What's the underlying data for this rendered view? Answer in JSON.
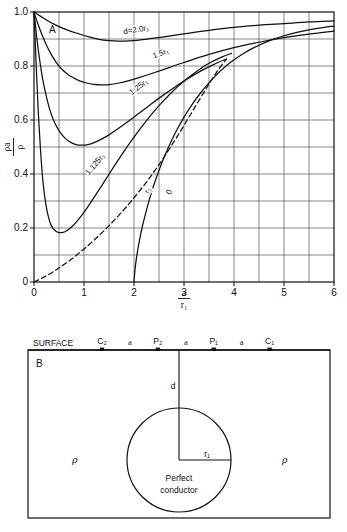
{
  "figure": {
    "panel_a_label": "A",
    "panel_b_label": "B"
  },
  "chart_data": {
    "type": "line",
    "title": "",
    "xlabel_numerator": "a",
    "xlabel_denominator": "r₁",
    "ylabel_numerator": "ρa",
    "ylabel_denominator": "ρ",
    "xlim": [
      0,
      6
    ],
    "ylim": [
      0,
      1.0
    ],
    "grid": true,
    "x_major_ticks": [
      0,
      1,
      2,
      3,
      4,
      5,
      6
    ],
    "x_major_tick_labels": [
      "0",
      "1",
      "2",
      "3",
      "4",
      "5",
      "6"
    ],
    "x_minor_step": 0.5,
    "y_major_ticks": [
      0,
      0.2,
      0.4,
      0.6,
      0.8,
      1.0
    ],
    "y_major_tick_labels": [
      "0",
      "0.2",
      "0.4",
      "0.6",
      "0.8",
      "1.0"
    ],
    "y_minor_step": 0.1,
    "legend_position": "inline-annotations",
    "series": [
      {
        "name": "d=2.0r₁",
        "label": "d=2.0r₁",
        "style": "solid",
        "label_x": 2.05,
        "label_y": 0.925,
        "label_rotation": -9,
        "points": [
          [
            0.0,
            1.0
          ],
          [
            0.1,
            0.988
          ],
          [
            0.2,
            0.976
          ],
          [
            0.3,
            0.965
          ],
          [
            0.4,
            0.955
          ],
          [
            0.5,
            0.946
          ],
          [
            0.7,
            0.931
          ],
          [
            0.9,
            0.919
          ],
          [
            1.1,
            0.908
          ],
          [
            1.3,
            0.899
          ],
          [
            1.5,
            0.894
          ],
          [
            1.7,
            0.892
          ],
          [
            1.9,
            0.893
          ],
          [
            2.1,
            0.896
          ],
          [
            2.4,
            0.903
          ],
          [
            2.7,
            0.911
          ],
          [
            3.0,
            0.919
          ],
          [
            3.5,
            0.932
          ],
          [
            4.0,
            0.943
          ],
          [
            4.5,
            0.951
          ],
          [
            5.0,
            0.957
          ],
          [
            5.5,
            0.963
          ],
          [
            6.0,
            0.967
          ]
        ]
      },
      {
        "name": "1.5r₁",
        "label": "1.5r₁",
        "style": "solid",
        "label_x": 2.55,
        "label_y": 0.838,
        "label_rotation": -20,
        "points": [
          [
            0.0,
            1.0
          ],
          [
            0.07,
            0.96
          ],
          [
            0.15,
            0.92
          ],
          [
            0.25,
            0.877
          ],
          [
            0.35,
            0.841
          ],
          [
            0.45,
            0.812
          ],
          [
            0.55,
            0.79
          ],
          [
            0.65,
            0.773
          ],
          [
            0.75,
            0.76
          ],
          [
            0.9,
            0.746
          ],
          [
            1.05,
            0.737
          ],
          [
            1.2,
            0.732
          ],
          [
            1.35,
            0.73
          ],
          [
            1.5,
            0.731
          ],
          [
            1.7,
            0.737
          ],
          [
            1.9,
            0.746
          ],
          [
            2.1,
            0.757
          ],
          [
            2.4,
            0.775
          ],
          [
            2.7,
            0.794
          ],
          [
            3.0,
            0.813
          ],
          [
            3.5,
            0.843
          ],
          [
            4.0,
            0.868
          ],
          [
            4.5,
            0.888
          ],
          [
            5.0,
            0.905
          ],
          [
            5.5,
            0.918
          ],
          [
            6.0,
            0.929
          ]
        ]
      },
      {
        "name": "1.25r₁",
        "label": "1.25r₁",
        "style": "solid",
        "label_x": 2.12,
        "label_y": 0.715,
        "label_rotation": -37,
        "points": [
          [
            0.0,
            1.0
          ],
          [
            0.05,
            0.915
          ],
          [
            0.1,
            0.84
          ],
          [
            0.17,
            0.755
          ],
          [
            0.25,
            0.685
          ],
          [
            0.33,
            0.63
          ],
          [
            0.42,
            0.587
          ],
          [
            0.52,
            0.555
          ],
          [
            0.62,
            0.533
          ],
          [
            0.72,
            0.519
          ],
          [
            0.84,
            0.509
          ],
          [
            0.96,
            0.507
          ],
          [
            1.08,
            0.509
          ],
          [
            1.2,
            0.516
          ],
          [
            1.35,
            0.529
          ],
          [
            1.5,
            0.545
          ],
          [
            1.7,
            0.57
          ],
          [
            1.9,
            0.597
          ],
          [
            2.1,
            0.625
          ],
          [
            2.35,
            0.66
          ],
          [
            2.6,
            0.694
          ],
          [
            2.85,
            0.726
          ],
          [
            3.1,
            0.756
          ],
          [
            3.35,
            0.783
          ],
          [
            3.6,
            0.806
          ],
          [
            3.85,
            0.826
          ]
        ]
      },
      {
        "name": "1.125r₁",
        "label": "1.125r₁",
        "style": "solid",
        "label_x": 1.26,
        "label_y": 0.43,
        "label_rotation": -50,
        "points": [
          [
            0.0,
            1.0
          ],
          [
            0.04,
            0.82
          ],
          [
            0.08,
            0.65
          ],
          [
            0.13,
            0.49
          ],
          [
            0.18,
            0.37
          ],
          [
            0.24,
            0.285
          ],
          [
            0.3,
            0.233
          ],
          [
            0.36,
            0.204
          ],
          [
            0.43,
            0.189
          ],
          [
            0.5,
            0.183
          ],
          [
            0.58,
            0.184
          ],
          [
            0.66,
            0.191
          ],
          [
            0.75,
            0.204
          ],
          [
            0.85,
            0.223
          ],
          [
            0.95,
            0.246
          ],
          [
            1.1,
            0.285
          ],
          [
            1.25,
            0.327
          ],
          [
            1.4,
            0.37
          ],
          [
            1.6,
            0.428
          ],
          [
            1.8,
            0.484
          ],
          [
            2.0,
            0.537
          ],
          [
            2.25,
            0.598
          ],
          [
            2.5,
            0.653
          ],
          [
            2.75,
            0.702
          ],
          [
            3.0,
            0.744
          ],
          [
            3.25,
            0.78
          ],
          [
            3.5,
            0.81
          ],
          [
            3.75,
            0.833
          ],
          [
            3.95,
            0.847
          ]
        ]
      },
      {
        "name": "r₁",
        "label": "r₁",
        "style": "dashed",
        "label_x": 2.32,
        "label_y": 0.335,
        "label_rotation": -63,
        "points": [
          [
            0.0,
            0.0
          ],
          [
            0.2,
            0.018
          ],
          [
            0.4,
            0.04
          ],
          [
            0.6,
            0.065
          ],
          [
            0.8,
            0.092
          ],
          [
            1.0,
            0.122
          ],
          [
            1.2,
            0.155
          ],
          [
            1.4,
            0.19
          ],
          [
            1.6,
            0.228
          ],
          [
            1.8,
            0.268
          ],
          [
            2.0,
            0.312
          ],
          [
            2.2,
            0.358
          ],
          [
            2.4,
            0.408
          ],
          [
            2.6,
            0.462
          ],
          [
            2.8,
            0.52
          ],
          [
            3.0,
            0.58
          ],
          [
            3.2,
            0.642
          ],
          [
            3.4,
            0.703
          ],
          [
            3.55,
            0.748
          ],
          [
            3.7,
            0.79
          ],
          [
            3.85,
            0.826
          ]
        ]
      },
      {
        "name": "0",
        "label": "0",
        "style": "solid",
        "label_x": 2.75,
        "label_y": 0.33,
        "label_rotation": -68,
        "points": [
          [
            2.0,
            0.0
          ],
          [
            2.02,
            0.045
          ],
          [
            2.05,
            0.09
          ],
          [
            2.1,
            0.145
          ],
          [
            2.16,
            0.2
          ],
          [
            2.24,
            0.26
          ],
          [
            2.33,
            0.32
          ],
          [
            2.43,
            0.378
          ],
          [
            2.55,
            0.438
          ],
          [
            2.68,
            0.495
          ],
          [
            2.82,
            0.55
          ],
          [
            2.98,
            0.604
          ],
          [
            3.15,
            0.654
          ],
          [
            3.33,
            0.7
          ],
          [
            3.52,
            0.742
          ],
          [
            3.72,
            0.78
          ],
          [
            3.92,
            0.812
          ],
          [
            4.15,
            0.842
          ],
          [
            4.4,
            0.868
          ],
          [
            4.7,
            0.893
          ],
          [
            5.0,
            0.912
          ],
          [
            5.4,
            0.93
          ],
          [
            5.7,
            0.94
          ],
          [
            6.0,
            0.948
          ]
        ]
      }
    ]
  },
  "diagram": {
    "surface_label": "SURFACE",
    "electrodes": [
      {
        "name": "C₂",
        "x_frac": 0.245
      },
      {
        "name": "P₂",
        "x_frac": 0.43
      },
      {
        "name": "P₁",
        "x_frac": 0.615
      },
      {
        "name": "C₁",
        "x_frac": 0.8
      }
    ],
    "spacing_labels": [
      "a",
      "a",
      "a"
    ],
    "depth_label": "d",
    "radius_label": "r₁",
    "conductor_label_line1": "Perfect",
    "conductor_label_line2": "conductor",
    "resistivity_left": "ρ",
    "resistivity_right": "ρ"
  },
  "colors": {
    "ink": "#111111",
    "grid": "#555555",
    "background": "#ffffff"
  }
}
